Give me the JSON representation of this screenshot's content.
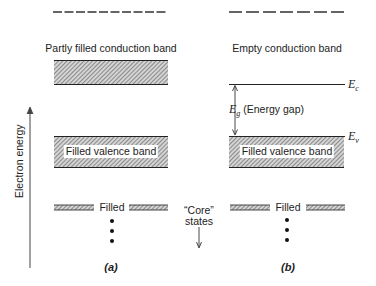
{
  "figure": {
    "axis": {
      "label": "Electron energy",
      "direction": "up"
    },
    "panels": [
      {
        "id": "a",
        "caption": "(a)",
        "top_label": "Partly filled conduction band",
        "bands": [
          {
            "name": "higher-states",
            "style": "dashed"
          },
          {
            "name": "conduction-band",
            "style": "hatched",
            "fill": "partly filled"
          },
          {
            "name": "valence-band",
            "style": "hatched",
            "label": "Filled valence band"
          },
          {
            "name": "core-band",
            "style": "hatched-thin",
            "label": "Filled"
          }
        ],
        "ellipsis": "•\n•\n•"
      },
      {
        "id": "b",
        "caption": "(b)",
        "top_label": "Empty conduction band",
        "ec_label": "E",
        "ec_sub": "c",
        "ev_label": "E",
        "ev_sub": "v",
        "gap_label_symbol": "E",
        "gap_label_sub": "g",
        "gap_label_text": "(Energy gap)",
        "bands": [
          {
            "name": "higher-states",
            "style": "dashed"
          },
          {
            "name": "conduction-band-edge",
            "style": "line"
          },
          {
            "name": "valence-band",
            "style": "hatched",
            "label": "Filled valence band"
          },
          {
            "name": "core-band",
            "style": "hatched-thin",
            "label": "Filled"
          }
        ]
      }
    ],
    "core_states": {
      "line1": "“Core”",
      "line2": "states",
      "direction": "down"
    },
    "colors": {
      "ink": "#222222",
      "hatch_light": "#cfcfcf",
      "hatch_dark": "#6a6a6a",
      "background": "#ffffff"
    }
  }
}
